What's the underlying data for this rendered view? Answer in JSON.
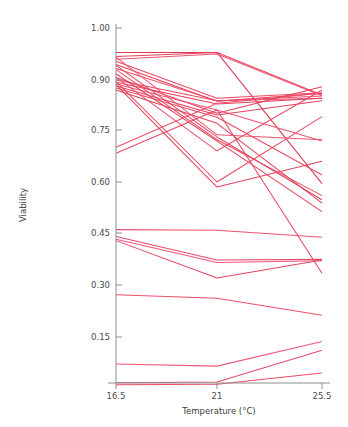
{
  "chart_data": {
    "type": "line",
    "title": "",
    "subtitle": "",
    "xlabel": "Temperature (°C)",
    "ylabel": "Viability",
    "categories": [
      "16.5",
      "21",
      "25.5"
    ],
    "x": [
      16.5,
      21,
      25.5
    ],
    "xtick_labels": [
      "16.5",
      "21",
      "25.5"
    ],
    "ytick_labels": [
      "1.00",
      "0.90",
      "0.75",
      "0.60",
      "0.45",
      "0.30",
      "0.15"
    ],
    "ytick_values": [
      1.0,
      0.9,
      0.75,
      0.6,
      0.45,
      0.3,
      0.15
    ],
    "ylim": [
      0.0,
      1.0
    ],
    "xlim": [
      16.5,
      25.5
    ],
    "grid": false,
    "legend": "none",
    "axis_color": "#8d8d8d",
    "note": "parallel-coordinate style profile plot; one polyline per sample across three temperatures",
    "series": [
      {
        "name": "s01",
        "color": "#e8435a",
        "values": [
          0.945,
          0.953,
          0.855
        ]
      },
      {
        "name": "s02",
        "color": "#ef5573",
        "values": [
          0.94,
          0.95,
          0.853
        ]
      },
      {
        "name": "s03",
        "color": "#e03a52",
        "values": [
          0.953,
          0.953,
          0.595
        ]
      },
      {
        "name": "s04",
        "color": "#ec4862",
        "values": [
          0.936,
          0.845,
          0.862
        ]
      },
      {
        "name": "s05",
        "color": "#e5415c",
        "values": [
          0.93,
          0.836,
          0.86
        ]
      },
      {
        "name": "s06",
        "color": "#f05070",
        "values": [
          0.922,
          0.838,
          0.852
        ]
      },
      {
        "name": "s07",
        "color": "#e74360",
        "values": [
          0.905,
          0.8,
          0.88
        ]
      },
      {
        "name": "s08",
        "color": "#ea4a66",
        "values": [
          0.9,
          0.838,
          0.845
        ]
      },
      {
        "name": "s09",
        "color": "#e53d58",
        "values": [
          0.893,
          0.828,
          0.845
        ]
      },
      {
        "name": "s10",
        "color": "#ee5574",
        "values": [
          0.888,
          0.81,
          0.718
        ]
      },
      {
        "name": "s11",
        "color": "#e2405a",
        "values": [
          0.882,
          0.795,
          0.838
        ]
      },
      {
        "name": "s12",
        "color": "#e94a63",
        "values": [
          0.876,
          0.788,
          0.62
        ]
      },
      {
        "name": "s13",
        "color": "#e04058",
        "values": [
          0.87,
          0.77,
          0.538
        ]
      },
      {
        "name": "s14",
        "color": "#f2536f",
        "values": [
          0.944,
          0.736,
          0.722
        ]
      },
      {
        "name": "s15",
        "color": "#e1455e",
        "values": [
          0.928,
          0.73,
          0.548
        ]
      },
      {
        "name": "s16",
        "color": "#eb4d69",
        "values": [
          0.92,
          0.722,
          0.56
        ]
      },
      {
        "name": "s17",
        "color": "#e34156",
        "values": [
          0.912,
          0.718,
          0.513
        ]
      },
      {
        "name": "s18",
        "color": "#ec4d68",
        "values": [
          0.905,
          0.69,
          0.87
        ]
      },
      {
        "name": "s19",
        "color": "#e54a64",
        "values": [
          0.896,
          0.6,
          0.79
        ]
      },
      {
        "name": "s20",
        "color": "#e0425c",
        "values": [
          0.886,
          0.585,
          0.66
        ]
      },
      {
        "name": "s21",
        "color": "#ee4f6b",
        "values": [
          0.7,
          0.83,
          0.86
        ]
      },
      {
        "name": "s22",
        "color": "#e74862",
        "values": [
          0.683,
          0.81,
          0.334
        ]
      },
      {
        "name": "s23",
        "color": "#ed5370",
        "values": [
          0.46,
          0.458,
          0.438
        ]
      },
      {
        "name": "s24",
        "color": "#e8476a",
        "values": [
          0.44,
          0.372,
          0.374
        ]
      },
      {
        "name": "s25",
        "color": "#f0567a",
        "values": [
          0.432,
          0.365,
          0.37
        ]
      },
      {
        "name": "s26",
        "color": "#e4445f",
        "values": [
          0.428,
          0.32,
          0.372
        ]
      },
      {
        "name": "s27",
        "color": "#ec4f6c",
        "values": [
          0.272,
          0.262,
          0.213
        ]
      },
      {
        "name": "s28",
        "color": "#ef5876",
        "values": [
          0.072,
          0.066,
          0.137
        ]
      },
      {
        "name": "s29",
        "color": "#e74b68",
        "values": [
          0.018,
          0.02,
          0.112
        ]
      },
      {
        "name": "s30",
        "color": "#ea4d6a",
        "values": [
          0.012,
          0.014,
          0.046
        ]
      }
    ],
    "plot_geometry": {
      "x_pixels": [
        116,
        217,
        322
      ],
      "y_tick_pixels": [
        28,
        80,
        130,
        182,
        233,
        285,
        337
      ],
      "baseline_pixel": 383
    }
  }
}
